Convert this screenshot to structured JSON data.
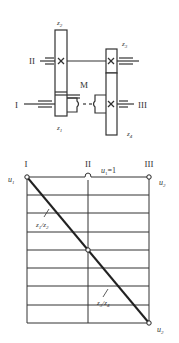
{
  "gear_diagram": {
    "shaft_labels": {
      "shaft_1": "I",
      "shaft_2": "II",
      "shaft_3": "III"
    },
    "gear_labels": {
      "z1": "z",
      "z1_sub": "1",
      "z2": "z",
      "z2_sub": "2",
      "z3": "z",
      "z3_sub": "3",
      "z4": "z",
      "z4_sub": "4"
    },
    "clutch_label": "M"
  },
  "speed_chart": {
    "column_labels": [
      "I",
      "II",
      "III"
    ],
    "top_ratio_label": "u",
    "top_ratio_sub": "1",
    "top_ratio_value": "=1",
    "left_label": "u",
    "left_label_sub": "1",
    "right_top_label": "u",
    "right_top_label_sub": "2",
    "right_bottom_label": "u",
    "right_bottom_label_sub": "2",
    "ratio_label_1": "z",
    "ratio_label_1_sub_a": "1",
    "ratio_label_1_mid": "/z",
    "ratio_label_1_sub_b": "2",
    "ratio_label_2": "z",
    "ratio_label_2_sub_a": "3",
    "ratio_label_2_mid": "/z",
    "ratio_label_2_sub_b": "4",
    "horizontal_divisions": 8,
    "colors": {
      "line": "#333333",
      "background": "#ffffff"
    }
  }
}
